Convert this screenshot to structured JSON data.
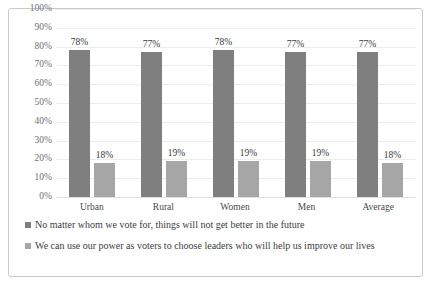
{
  "chart_data": {
    "type": "bar",
    "title": "",
    "xlabel": "",
    "ylabel": "",
    "ylim": [
      0,
      100
    ],
    "grid": true,
    "legend_position": "bottom",
    "categories": [
      "Urban",
      "Rural",
      "Women",
      "Men",
      "Average"
    ],
    "y_ticks": [
      "0%",
      "10%",
      "20%",
      "30%",
      "40%",
      "50%",
      "60%",
      "70%",
      "80%",
      "90%",
      "100%"
    ],
    "y_tick_values": [
      0,
      10,
      20,
      30,
      40,
      50,
      60,
      70,
      80,
      90,
      100
    ],
    "series": [
      {
        "name": "No matter whom we vote for, things will not get better in the future",
        "color": "#7f7f7f",
        "values": [
          78,
          77,
          78,
          77,
          77
        ],
        "labels": [
          "78%",
          "77%",
          "78%",
          "77%",
          "77%"
        ]
      },
      {
        "name": "We can use our power as voters to choose leaders who will help us improve our lives",
        "color": "#a6a6a6",
        "values": [
          18,
          19,
          19,
          19,
          18
        ],
        "labels": [
          "18%",
          "19%",
          "19%",
          "19%",
          "18%"
        ]
      }
    ]
  },
  "legend": {
    "items": [
      {
        "marker": "legend-swatch-series-1",
        "label": "No matter whom we vote for, things will not get better in the future"
      },
      {
        "marker": "legend-swatch-series-2",
        "label": "We can use our power as voters to choose leaders who will help us improve our lives"
      }
    ]
  },
  "colors": {
    "series_1": "#7f7f7f",
    "series_2": "#a6a6a6",
    "gridline": "#ededed",
    "border": "#c9c9c9",
    "background": "#ffffff",
    "tick_text": "#6f6f6f",
    "label_text": "#3a3a3a"
  }
}
